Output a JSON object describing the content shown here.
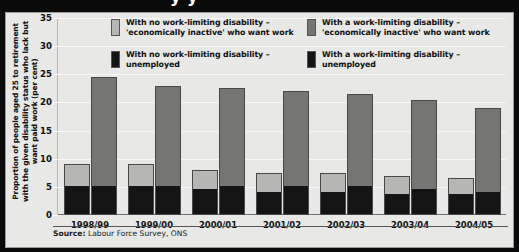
{
  "header": {
    "title_partial": "y  y"
  },
  "axis": {
    "y_title": "Proportion of people aged 25 to retirement with the given disability status who lack but want paid work (per cent)",
    "y_ticks": [
      "0",
      "5",
      "10",
      "15",
      "20",
      "25",
      "30",
      "35"
    ],
    "x_labels": [
      "1998/99",
      "1999/00",
      "2000/01",
      "2001/02",
      "2002/03",
      "2003/04",
      "2004/05"
    ]
  },
  "legend": {
    "items": [
      {
        "name": "no-disability-inactive",
        "color": "#b6b6b4",
        "line1": "With no work-limiting disability –",
        "line2": "'economically inactive' who want work"
      },
      {
        "name": "disability-inactive",
        "color": "#757573",
        "line1": "With a work-limiting disability –",
        "line2": "'economically inactive' who want work"
      },
      {
        "name": "no-disability-unemployed",
        "color": "#141414",
        "line1": "With no work-limiting disability –",
        "line2": "unemployed"
      },
      {
        "name": "disability-unemployed",
        "color": "#141414",
        "line1": "With a work-limiting disability –",
        "line2": "unemployed"
      }
    ]
  },
  "source": {
    "label": "Source:",
    "text": " Labour Force Survey, ONS"
  },
  "chart_data": {
    "type": "bar",
    "title": "",
    "xlabel": "",
    "ylabel": "Proportion of people aged 25 to retirement with the given disability status who lack but want paid work (per cent)",
    "ylim": [
      0,
      35
    ],
    "ytick_step": 5,
    "grid": true,
    "legend_position": "top",
    "stacked": true,
    "categories": [
      "1998/99",
      "1999/00",
      "2000/01",
      "2001/02",
      "2002/03",
      "2003/04",
      "2004/05"
    ],
    "series": [
      {
        "name": "With no work-limiting disability – unemployed",
        "color": "#141414",
        "group": "no-disability",
        "stack_part": "bottom",
        "values": [
          5.0,
          5.0,
          4.5,
          4.0,
          4.0,
          3.5,
          3.5
        ]
      },
      {
        "name": "With no work-limiting disability – 'economically inactive' who want work",
        "color": "#b6b6b4",
        "group": "no-disability",
        "stack_part": "top",
        "values": [
          4.0,
          4.0,
          3.5,
          3.5,
          3.5,
          3.5,
          3.0
        ]
      },
      {
        "name": "With a work-limiting disability – unemployed",
        "color": "#141414",
        "group": "disability",
        "stack_part": "bottom",
        "values": [
          5.0,
          5.0,
          5.0,
          5.0,
          5.0,
          4.5,
          4.0
        ]
      },
      {
        "name": "With a work-limiting disability – 'economically inactive' who want work",
        "color": "#757573",
        "group": "disability",
        "stack_part": "top",
        "values": [
          19.5,
          18.0,
          17.5,
          17.0,
          16.5,
          16.0,
          15.0
        ]
      }
    ],
    "totals": {
      "no_disability": [
        9.0,
        9.0,
        8.0,
        7.5,
        7.5,
        7.0,
        6.5
      ],
      "disability": [
        24.5,
        23.0,
        22.5,
        22.0,
        21.5,
        20.5,
        19.0
      ]
    }
  },
  "colors": {
    "light_grey": "#b6b6b4",
    "mid_grey": "#757573",
    "black": "#141414",
    "panel_bg": "#e8e8e6",
    "frame": "#0a0a0a"
  }
}
